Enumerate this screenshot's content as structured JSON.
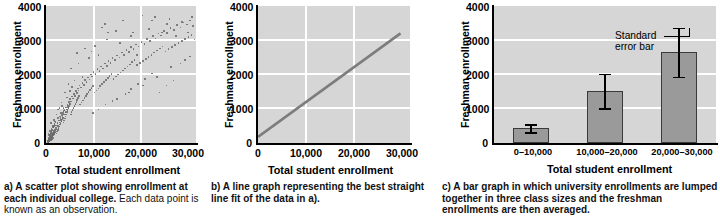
{
  "figure": {
    "panels": [
      {
        "id": "a",
        "caption_lead": "a) A scatter plot showing enrollment at each individual college.",
        "caption_tail": " Each data point is known as an observation.",
        "chart_index": 0
      },
      {
        "id": "b",
        "caption_lead": "b) A line graph representing the best straight line fit of the data in a).",
        "caption_tail": "",
        "chart_index": 1
      },
      {
        "id": "c",
        "caption_lead": "c) A bar graph in which university enrollments are lumped together in three class sizes and the freshman enrollments are then averaged.",
        "caption_tail": "",
        "chart_index": 2
      }
    ]
  },
  "axes_common": {
    "xlabel": "Total student enrollment",
    "ylabel": "Freshman enrollment",
    "yticks": [
      "0",
      "1000",
      "2000",
      "3000",
      "4000"
    ],
    "ytick_values": [
      0,
      1000,
      2000,
      3000,
      4000
    ],
    "ylim": [
      0,
      4000
    ],
    "xticks": [
      "0",
      "10,000",
      "20,000",
      "30,000"
    ],
    "xtick_values": [
      0,
      10000,
      20000,
      30000
    ],
    "xlim": [
      0,
      32000
    ]
  },
  "colors": {
    "plot_background": "#d6d6d6",
    "gridline": "#ffffff",
    "axis": "#000000",
    "scatter_point": "#6a6a6a",
    "line": "#7d7d7d",
    "bar_fill": "#9a9a9a",
    "bar_edge": "#3a3a3a",
    "error_bar": "#000000",
    "text": "#000000"
  },
  "chart_data": [
    {
      "type": "scatter",
      "title": "",
      "xlabel": "Total student enrollment",
      "ylabel": "Freshman enrollment",
      "xlim": [
        0,
        32000
      ],
      "ylim": [
        0,
        4000
      ],
      "grid": true,
      "xticks": [
        0,
        10000,
        20000,
        30000
      ],
      "yticks": [
        0,
        1000,
        2000,
        3000,
        4000
      ],
      "n_points": 420,
      "description": "Positively correlated cloud of college enrollments; dense near origin, spreading out toward 30,000 total / 3,500 freshman.",
      "points": [
        [
          300,
          60
        ],
        [
          420,
          90
        ],
        [
          520,
          120
        ],
        [
          610,
          140
        ],
        [
          700,
          95
        ],
        [
          780,
          180
        ],
        [
          860,
          150
        ],
        [
          930,
          210
        ],
        [
          1010,
          170
        ],
        [
          1090,
          240
        ],
        [
          1180,
          200
        ],
        [
          1260,
          290
        ],
        [
          1340,
          250
        ],
        [
          1420,
          330
        ],
        [
          1500,
          280
        ],
        [
          1580,
          360
        ],
        [
          1660,
          310
        ],
        [
          1740,
          400
        ],
        [
          1820,
          350
        ],
        [
          1900,
          430
        ],
        [
          400,
          150
        ],
        [
          560,
          210
        ],
        [
          720,
          260
        ],
        [
          880,
          310
        ],
        [
          1040,
          370
        ],
        [
          1200,
          420
        ],
        [
          1360,
          470
        ],
        [
          1520,
          520
        ],
        [
          1680,
          580
        ],
        [
          1840,
          630
        ],
        [
          350,
          40
        ],
        [
          480,
          70
        ],
        [
          600,
          100
        ],
        [
          730,
          130
        ],
        [
          850,
          160
        ],
        [
          980,
          190
        ],
        [
          1100,
          220
        ],
        [
          1230,
          250
        ],
        [
          1350,
          280
        ],
        [
          1480,
          310
        ],
        [
          2000,
          480
        ],
        [
          2150,
          540
        ],
        [
          2300,
          600
        ],
        [
          2450,
          520
        ],
        [
          2600,
          680
        ],
        [
          2750,
          620
        ],
        [
          2900,
          760
        ],
        [
          3050,
          700
        ],
        [
          3200,
          840
        ],
        [
          3350,
          780
        ],
        [
          2050,
          300
        ],
        [
          2200,
          360
        ],
        [
          2350,
          410
        ],
        [
          2500,
          460
        ],
        [
          2650,
          510
        ],
        [
          2800,
          560
        ],
        [
          2950,
          610
        ],
        [
          3100,
          660
        ],
        [
          3250,
          710
        ],
        [
          3400,
          760
        ],
        [
          3500,
          900
        ],
        [
          3650,
          850
        ],
        [
          3800,
          980
        ],
        [
          3950,
          920
        ],
        [
          4100,
          1060
        ],
        [
          4250,
          1000
        ],
        [
          4400,
          1140
        ],
        [
          4550,
          1080
        ],
        [
          4700,
          1220
        ],
        [
          4850,
          1160
        ],
        [
          3550,
          620
        ],
        [
          3700,
          680
        ],
        [
          3850,
          740
        ],
        [
          4000,
          800
        ],
        [
          4150,
          860
        ],
        [
          4300,
          920
        ],
        [
          4450,
          980
        ],
        [
          4600,
          1040
        ],
        [
          4750,
          1100
        ],
        [
          4900,
          1160
        ],
        [
          5000,
          1300
        ],
        [
          5200,
          1240
        ],
        [
          5400,
          1380
        ],
        [
          5600,
          1320
        ],
        [
          5800,
          1460
        ],
        [
          6000,
          1400
        ],
        [
          6200,
          1540
        ],
        [
          6400,
          1480
        ],
        [
          6600,
          1620
        ],
        [
          6800,
          1560
        ],
        [
          5100,
          860
        ],
        [
          5300,
          920
        ],
        [
          5500,
          980
        ],
        [
          5700,
          1040
        ],
        [
          5900,
          1100
        ],
        [
          6100,
          1160
        ],
        [
          6300,
          1220
        ],
        [
          6500,
          1280
        ],
        [
          6700,
          1340
        ],
        [
          6900,
          1400
        ],
        [
          7000,
          1700
        ],
        [
          7300,
          1640
        ],
        [
          7600,
          1780
        ],
        [
          7900,
          1720
        ],
        [
          8200,
          1860
        ],
        [
          8500,
          1800
        ],
        [
          8800,
          1940
        ],
        [
          9100,
          1880
        ],
        [
          9400,
          2020
        ],
        [
          9700,
          1960
        ],
        [
          7100,
          1150
        ],
        [
          7400,
          1210
        ],
        [
          7700,
          1270
        ],
        [
          8000,
          1330
        ],
        [
          8300,
          1390
        ],
        [
          8600,
          1450
        ],
        [
          8900,
          1510
        ],
        [
          9200,
          1570
        ],
        [
          9500,
          1630
        ],
        [
          9800,
          1690
        ],
        [
          10000,
          2100
        ],
        [
          10400,
          2040
        ],
        [
          10800,
          2180
        ],
        [
          11200,
          2120
        ],
        [
          11600,
          2260
        ],
        [
          12000,
          2200
        ],
        [
          12400,
          2340
        ],
        [
          12800,
          2280
        ],
        [
          13200,
          2420
        ],
        [
          13600,
          2360
        ],
        [
          10200,
          1500
        ],
        [
          10600,
          1560
        ],
        [
          11000,
          1620
        ],
        [
          11400,
          1680
        ],
        [
          11800,
          1740
        ],
        [
          12200,
          1800
        ],
        [
          12600,
          1860
        ],
        [
          13000,
          1920
        ],
        [
          13400,
          1980
        ],
        [
          13800,
          2040
        ],
        [
          14000,
          2500
        ],
        [
          14500,
          2440
        ],
        [
          15000,
          2580
        ],
        [
          15500,
          2520
        ],
        [
          16000,
          2660
        ],
        [
          16500,
          2600
        ],
        [
          17000,
          2740
        ],
        [
          17500,
          2680
        ],
        [
          18000,
          2820
        ],
        [
          18500,
          2760
        ],
        [
          14200,
          1900
        ],
        [
          14700,
          1960
        ],
        [
          15200,
          2020
        ],
        [
          15700,
          2080
        ],
        [
          16200,
          2140
        ],
        [
          16700,
          2200
        ],
        [
          17200,
          2260
        ],
        [
          17700,
          2320
        ],
        [
          18200,
          2380
        ],
        [
          18700,
          2440
        ],
        [
          19000,
          2900
        ],
        [
          19600,
          2840
        ],
        [
          20200,
          2980
        ],
        [
          20800,
          2920
        ],
        [
          21400,
          3060
        ],
        [
          22000,
          3000
        ],
        [
          22600,
          3140
        ],
        [
          23200,
          3080
        ],
        [
          23800,
          3220
        ],
        [
          24400,
          3160
        ],
        [
          19300,
          2300
        ],
        [
          19900,
          2360
        ],
        [
          20500,
          2420
        ],
        [
          21100,
          2480
        ],
        [
          21700,
          2540
        ],
        [
          22300,
          2600
        ],
        [
          22900,
          2660
        ],
        [
          23500,
          2720
        ],
        [
          24100,
          2780
        ],
        [
          24700,
          2840
        ],
        [
          25000,
          3300
        ],
        [
          25700,
          3240
        ],
        [
          26400,
          3380
        ],
        [
          27100,
          3320
        ],
        [
          27800,
          3460
        ],
        [
          28500,
          3400
        ],
        [
          29200,
          3540
        ],
        [
          29900,
          3480
        ],
        [
          30600,
          3600
        ],
        [
          31200,
          3440
        ],
        [
          25300,
          2700
        ],
        [
          26000,
          2760
        ],
        [
          26700,
          2820
        ],
        [
          27400,
          2880
        ],
        [
          28100,
          2940
        ],
        [
          28800,
          3000
        ],
        [
          29500,
          3060
        ],
        [
          30200,
          3120
        ],
        [
          30900,
          3180
        ],
        [
          31500,
          3050
        ],
        [
          6500,
          2650
        ],
        [
          8200,
          2780
        ],
        [
          9500,
          2700
        ],
        [
          11800,
          3400
        ],
        [
          12400,
          3500
        ],
        [
          13100,
          3250
        ],
        [
          14800,
          3300
        ],
        [
          16300,
          3600
        ],
        [
          17900,
          3150
        ],
        [
          20400,
          3750
        ],
        [
          21800,
          3350
        ],
        [
          23100,
          3700
        ],
        [
          24600,
          3250
        ],
        [
          26200,
          3650
        ],
        [
          27500,
          3150
        ],
        [
          28900,
          3550
        ],
        [
          30100,
          3250
        ],
        [
          31000,
          3700
        ],
        [
          22400,
          3600
        ],
        [
          25600,
          3500
        ],
        [
          5200,
          2200
        ],
        [
          6800,
          2350
        ],
        [
          7600,
          1950
        ],
        [
          9000,
          2500
        ],
        [
          10300,
          2850
        ],
        [
          11000,
          2600
        ],
        [
          12900,
          3050
        ],
        [
          15600,
          2950
        ],
        [
          18400,
          3250
        ],
        [
          19200,
          2600
        ],
        [
          2400,
          1000
        ],
        [
          3100,
          1200
        ],
        [
          3900,
          1500
        ],
        [
          4600,
          1750
        ],
        [
          5400,
          1650
        ],
        [
          2800,
          800
        ],
        [
          3600,
          950
        ],
        [
          4300,
          1350
        ],
        [
          5000,
          1550
        ],
        [
          5900,
          1850
        ],
        [
          15000,
          1300
        ],
        [
          16800,
          1450
        ],
        [
          18000,
          1600
        ],
        [
          19500,
          1750
        ],
        [
          21000,
          1900
        ],
        [
          22500,
          2050
        ],
        [
          24000,
          1500
        ],
        [
          25500,
          1700
        ],
        [
          27000,
          1850
        ],
        [
          28500,
          2350
        ],
        [
          29500,
          2450
        ],
        [
          30500,
          2550
        ],
        [
          26500,
          2250
        ],
        [
          23500,
          1950
        ],
        [
          20500,
          1700
        ],
        [
          17500,
          1500
        ],
        [
          14000,
          1250
        ],
        [
          12500,
          1150
        ],
        [
          11000,
          1000
        ],
        [
          9800,
          900
        ],
        [
          900,
          600
        ],
        [
          1500,
          700
        ],
        [
          2100,
          850
        ],
        [
          2700,
          1050
        ],
        [
          3300,
          1100
        ],
        [
          1200,
          500
        ],
        [
          1800,
          650
        ],
        [
          2400,
          750
        ],
        [
          3000,
          900
        ],
        [
          3600,
          1050
        ],
        [
          400,
          300
        ],
        [
          700,
          380
        ],
        [
          1000,
          450
        ],
        [
          1300,
          520
        ],
        [
          1600,
          590
        ],
        [
          500,
          250
        ],
        [
          800,
          330
        ],
        [
          1100,
          400
        ],
        [
          1400,
          470
        ],
        [
          1700,
          540
        ],
        [
          200,
          100
        ],
        [
          350,
          180
        ],
        [
          500,
          160
        ],
        [
          650,
          230
        ],
        [
          800,
          120
        ],
        [
          950,
          280
        ],
        [
          1100,
          140
        ],
        [
          1250,
          320
        ],
        [
          1400,
          180
        ],
        [
          1550,
          380
        ],
        [
          250,
          80
        ],
        [
          400,
          130
        ],
        [
          550,
          90
        ],
        [
          700,
          170
        ],
        [
          850,
          110
        ],
        [
          1000,
          200
        ],
        [
          1150,
          130
        ],
        [
          1300,
          240
        ],
        [
          1450,
          150
        ],
        [
          1600,
          280
        ]
      ]
    },
    {
      "type": "line",
      "title": "",
      "xlabel": "Total student enrollment",
      "ylabel": "Freshman enrollment",
      "xlim": [
        0,
        32000
      ],
      "ylim": [
        0,
        4000
      ],
      "grid": true,
      "xticks": [
        0,
        10000,
        20000,
        30000
      ],
      "yticks": [
        0,
        1000,
        2000,
        3000,
        4000
      ],
      "series": [
        {
          "name": "best straight line fit",
          "x": [
            0,
            30000
          ],
          "y": [
            180,
            3200
          ]
        }
      ]
    },
    {
      "type": "bar",
      "title": "",
      "xlabel": "Total student enrollment",
      "ylabel": "Freshman enrollment",
      "xlim": [
        0,
        3
      ],
      "ylim": [
        0,
        4000
      ],
      "grid": true,
      "yticks": [
        0,
        1000,
        2000,
        3000,
        4000
      ],
      "categories": [
        "0–10,000",
        "10,000–20,000",
        "20,000–30,000"
      ],
      "values": [
        430,
        1520,
        2650
      ],
      "errors": [
        120,
        500,
        720
      ],
      "annotation": "Standard\nerror bar",
      "annotation_line1": "Standard",
      "annotation_line2": "error bar"
    }
  ]
}
